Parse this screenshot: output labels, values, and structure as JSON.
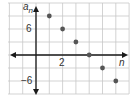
{
  "chart_data": {
    "type": "scatter",
    "title": "",
    "xlabel": "n",
    "ylabel": "a_n",
    "x": [
      1,
      2,
      3,
      4,
      5,
      6
    ],
    "series": [
      {
        "name": "a_n",
        "values": [
          9,
          6,
          3,
          0,
          -3,
          -6
        ]
      }
    ],
    "xticks_labeled": [
      2
    ],
    "yticks_labeled": [
      6,
      -6
    ],
    "x_grid_step": 1,
    "y_grid_step": 3,
    "xlim": [
      -2,
      7
    ],
    "ylim": [
      -12,
      12
    ],
    "grid": true,
    "legend": "none"
  },
  "labels": {
    "y_axis": "a",
    "y_axis_sub": "n",
    "x_axis": "n",
    "x_tick": "2",
    "y_tick_pos": "6",
    "y_tick_neg": "−6"
  },
  "colors": {
    "grid": "#c8c8c8",
    "axis": "#1a1a1a",
    "point": "#555555"
  }
}
